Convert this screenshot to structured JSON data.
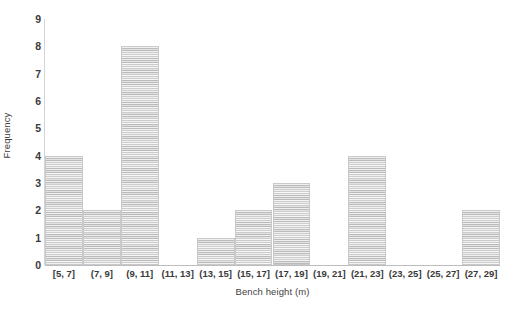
{
  "chart_data": {
    "type": "bar",
    "title": "",
    "xlabel": "Bench height (m)",
    "ylabel": "Frequency",
    "categories": [
      "[5, 7]",
      "(7, 9]",
      "(9, 11]",
      "(11, 13]",
      "(13, 15]",
      "(15, 17]",
      "(17, 19]",
      "(19, 21]",
      "(21, 23]",
      "(23, 25]",
      "(25, 27]",
      "(27, 29]"
    ],
    "values": [
      4,
      2,
      8,
      0,
      1,
      2,
      3,
      0,
      4,
      0,
      0,
      2
    ],
    "ylim": [
      0,
      9
    ],
    "ytick_labels": [
      "0",
      "1",
      "2",
      "3",
      "4",
      "5",
      "6",
      "7",
      "8",
      "9"
    ],
    "grid": false,
    "legend": null,
    "bar_fill_color": "#d8d8d8",
    "bar_edge_color": "#c9c9c9",
    "axis_color": "#bdbdbd",
    "text_color": "#3a3a3a"
  },
  "caption": {
    "partial_text": ""
  }
}
